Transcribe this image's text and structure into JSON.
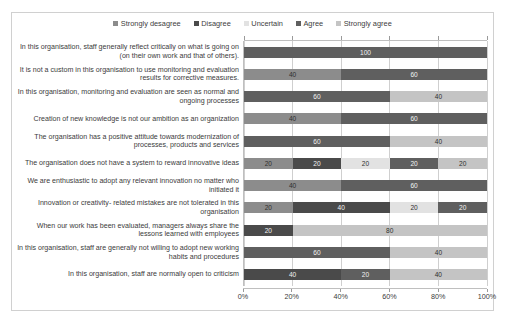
{
  "chart_data": {
    "type": "bar",
    "orientation": "horizontal",
    "stacked": true,
    "stack_mode": "percent",
    "title": "",
    "xlabel": "",
    "ylabel": "",
    "xlim": [
      0,
      100
    ],
    "grid": true,
    "legend_position": "top-center",
    "x_tick_labels": [
      "0%",
      "20%",
      "40%",
      "60%",
      "80%",
      "100%"
    ],
    "x_tick_values": [
      0,
      20,
      40,
      60,
      80,
      100
    ],
    "categories": [
      "In this organisation, staff generally reflect critically on what is going on (on their own work and that of others).",
      "It is not a custom in this organisation to use monitoring and evaluation results for corrective measures.",
      "In this organisation, monitoring and evaluation are seen as normal and ongoing processes",
      "Creation of new knowledge is not our ambition as an organization",
      "The organisation has a positive attitude towards modernization of processes, products and services",
      "The organisation does not have a system to reward innovative ideas",
      "We are enthusiastic to adopt any relevant innovation no matter who initiated it",
      "Innovation or creativity- related mistakes are not tolerated in this organisation",
      "When our work has been evaluated, managers always share the lessons learned with employees",
      "In this organisation, staff are generally not willing to adopt new working habits and procedures",
      "In this organisation, staff are normally open to criticism"
    ],
    "series": [
      {
        "name": "Strongly desagree",
        "color": "#8c8c8c",
        "values": [
          0,
          40,
          0,
          40,
          0,
          20,
          40,
          20,
          0,
          0,
          0
        ]
      },
      {
        "name": "Disagree",
        "color": "#4a4a4a",
        "values": [
          0,
          0,
          0,
          0,
          0,
          20,
          0,
          40,
          20,
          0,
          40
        ]
      },
      {
        "name": "Uncertain",
        "color": "#e2e2e2",
        "values": [
          0,
          0,
          0,
          0,
          0,
          20,
          0,
          20,
          0,
          0,
          0
        ]
      },
      {
        "name": "Agree",
        "color": "#5f5f5f",
        "values": [
          100,
          60,
          60,
          60,
          60,
          20,
          60,
          20,
          0,
          60,
          20
        ]
      },
      {
        "name": "Strongly agree",
        "color": "#c4c4c4",
        "values": [
          0,
          0,
          40,
          0,
          40,
          20,
          0,
          0,
          80,
          40,
          40
        ]
      }
    ],
    "zero_label": "0",
    "row_segment_labels": [
      [
        "0",
        "100",
        "0"
      ],
      [
        "40",
        "60",
        "0"
      ],
      [
        "0",
        "60",
        "40"
      ],
      [
        "40",
        "60",
        "0"
      ],
      [
        "0",
        "60",
        "40"
      ],
      [
        "20",
        "20",
        "20",
        "20",
        "20"
      ],
      [
        "40",
        "60",
        "0"
      ],
      [
        "20",
        "40",
        "20",
        "20",
        "0"
      ],
      [
        "0",
        "20",
        "80"
      ],
      [
        "0",
        "60",
        "0",
        "40",
        "0"
      ],
      [
        "0",
        "40",
        "40",
        "20",
        "0"
      ]
    ]
  }
}
